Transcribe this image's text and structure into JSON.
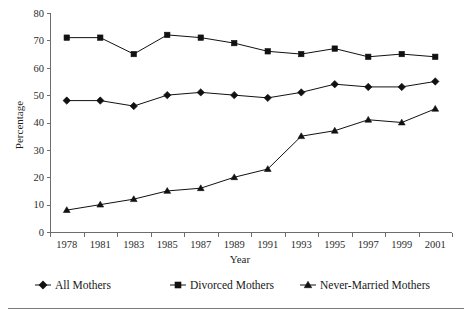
{
  "chart_data": {
    "type": "line",
    "title": "",
    "xlabel": "Year",
    "ylabel": "Percentage",
    "categories": [
      "1978",
      "1981",
      "1983",
      "1985",
      "1987",
      "1989",
      "1991",
      "1993",
      "1995",
      "1997",
      "1999",
      "2001"
    ],
    "ylim": [
      0,
      80
    ],
    "yticks": [
      "0",
      "10",
      "20",
      "30",
      "40",
      "50",
      "60",
      "70",
      "80"
    ],
    "grid": false,
    "legend_position": "bottom",
    "series": [
      {
        "name": "All Mothers",
        "marker": "diamond",
        "color": "#111111",
        "values": [
          48,
          48,
          46,
          50,
          51,
          50,
          49,
          51,
          54,
          53,
          53,
          55
        ]
      },
      {
        "name": "Divorced Mothers",
        "marker": "square",
        "color": "#111111",
        "values": [
          71,
          71,
          65,
          72,
          71,
          69,
          66,
          65,
          67,
          64,
          65,
          64
        ]
      },
      {
        "name": "Never-Married Mothers",
        "marker": "triangle",
        "color": "#111111",
        "values": [
          8,
          10,
          12,
          15,
          16,
          20,
          23,
          35,
          37,
          41,
          40,
          45
        ]
      }
    ]
  },
  "legend": {
    "items": [
      {
        "label": "All Mothers",
        "marker": "diamond"
      },
      {
        "label": "Divorced Mothers",
        "marker": "square"
      },
      {
        "label": "Never-Married Mothers",
        "marker": "triangle"
      }
    ]
  },
  "axes": {
    "x_title": "Year",
    "y_title": "Percentage"
  }
}
